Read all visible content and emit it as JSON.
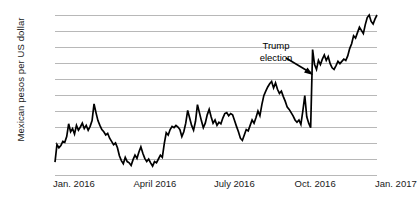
{
  "chart_data": {
    "type": "line",
    "title": "",
    "xlabel": "",
    "ylabel": "Mexican pesos per US dollar",
    "ylim": [
      17.0,
      22.0
    ],
    "ytick_labels": [
      "22.0",
      "21.5",
      "21.0",
      "20.5",
      "20.0",
      "19.5",
      "19.0",
      "18.5",
      "18.0",
      "17.5",
      "17.0"
    ],
    "ytick_values": [
      22.0,
      21.5,
      21.0,
      20.5,
      20.0,
      19.5,
      19.0,
      18.5,
      18.0,
      17.5,
      17.0
    ],
    "xtick_labels": [
      "Jan. 2016",
      "April 2016",
      "July 2016",
      "Oct. 2016",
      "Jan. 2017"
    ],
    "xtick_positions": [
      0,
      0.25,
      0.5,
      0.75,
      1.0
    ],
    "grid": "horizontal",
    "legend": "none",
    "line_color": "#000000",
    "grid_color": "#b8b8b8",
    "annotations": [
      {
        "text_line1": "Trump",
        "text_line2": "election",
        "target_x": 0.795,
        "target_y": 20.95
      }
    ],
    "series": [
      {
        "name": "MXN per USD",
        "values": [
          17.4,
          17.95,
          17.85,
          17.92,
          18.05,
          18.02,
          18.2,
          18.6,
          18.35,
          18.45,
          18.28,
          18.55,
          18.4,
          18.5,
          18.62,
          18.45,
          18.55,
          18.4,
          18.52,
          18.7,
          19.22,
          18.95,
          18.7,
          18.55,
          18.42,
          18.35,
          18.25,
          18.3,
          18.15,
          18.05,
          17.95,
          18.0,
          17.85,
          17.6,
          17.45,
          17.35,
          17.55,
          17.42,
          17.38,
          17.3,
          17.48,
          17.62,
          17.52,
          17.72,
          17.88,
          17.68,
          17.52,
          17.42,
          17.5,
          17.38,
          17.28,
          17.42,
          17.38,
          17.5,
          17.62,
          17.55,
          17.98,
          18.32,
          18.25,
          18.42,
          18.52,
          18.48,
          18.55,
          18.5,
          18.42,
          18.2,
          18.35,
          18.62,
          19.02,
          18.78,
          18.55,
          18.4,
          18.68,
          19.2,
          18.95,
          18.7,
          18.48,
          18.62,
          18.88,
          19.05,
          18.82,
          18.62,
          18.72,
          18.55,
          18.65,
          18.6,
          18.78,
          18.92,
          18.95,
          18.85,
          18.92,
          18.88,
          18.7,
          18.52,
          18.35,
          18.15,
          18.08,
          18.25,
          18.42,
          18.38,
          18.55,
          18.72,
          18.62,
          18.8,
          19.0,
          18.85,
          19.2,
          19.48,
          19.62,
          19.75,
          19.85,
          19.92,
          19.72,
          19.88,
          19.68,
          19.55,
          19.62,
          19.45,
          19.3,
          19.12,
          19.05,
          18.95,
          18.85,
          18.72,
          18.65,
          18.72,
          18.58,
          19.0,
          19.48,
          18.82,
          18.62,
          18.48,
          20.92,
          20.45,
          20.3,
          20.58,
          20.45,
          20.62,
          20.75,
          20.58,
          20.7,
          20.48,
          20.35,
          20.3,
          20.42,
          20.55,
          20.48,
          20.55,
          20.62,
          20.58,
          20.72,
          20.95,
          21.1,
          21.35,
          21.28,
          21.45,
          21.62,
          21.52,
          21.42,
          21.7,
          21.92,
          22.0,
          21.8,
          21.72,
          21.88,
          22.0
        ]
      }
    ]
  }
}
